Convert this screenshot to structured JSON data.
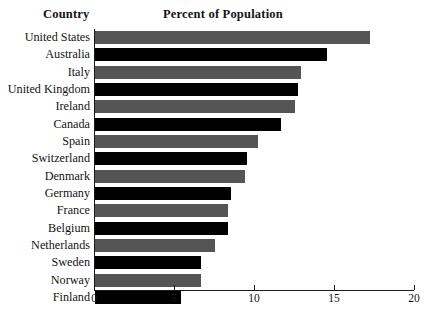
{
  "header": {
    "country_label": "Country",
    "title": "Percent of Population"
  },
  "axis": {
    "ticks": [
      {
        "value": 0,
        "label": "0"
      },
      {
        "value": 5,
        "label": "5"
      },
      {
        "value": 10,
        "label": "10"
      },
      {
        "value": 15,
        "label": "15"
      },
      {
        "value": 20,
        "label": "20"
      }
    ]
  },
  "chart_data": {
    "type": "bar",
    "orientation": "horizontal",
    "title": "Percent of Population",
    "xlabel": "",
    "ylabel": "Country",
    "xlim": [
      0,
      20
    ],
    "xticks": [
      0,
      5,
      10,
      15,
      20
    ],
    "grid": false,
    "legend": null,
    "bar_colors": [
      "#555555",
      "#000000"
    ],
    "categories": [
      "United States",
      "Australia",
      "Italy",
      "United Kingdom",
      "Ireland",
      "Canada",
      "Spain",
      "Switzerland",
      "Denmark",
      "Germany",
      "France",
      "Belgium",
      "Netherlands",
      "Sweden",
      "Norway",
      "Finland"
    ],
    "values": [
      17.2,
      14.5,
      12.9,
      12.7,
      12.5,
      11.6,
      10.2,
      9.5,
      9.4,
      8.5,
      8.3,
      8.3,
      7.5,
      6.6,
      6.6,
      5.4
    ]
  }
}
